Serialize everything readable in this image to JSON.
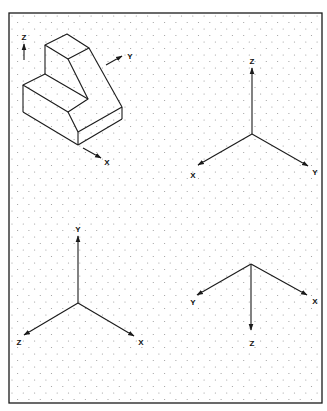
{
  "worksheet": {
    "frame": {
      "x": 9,
      "y": 13,
      "width": 313,
      "height": 390,
      "stroke": "#1a1a1a"
    },
    "dot_grid": {
      "origin_x": 12,
      "origin_y": 16,
      "dx": 11.3,
      "dy": 13,
      "color": "#9a9a9a"
    },
    "line_color": "#1a1a1a"
  },
  "object_view": {
    "title": "isometric-object",
    "axes": [
      {
        "label": "Z",
        "label_pos": [
          24,
          40
        ],
        "from": [
          24,
          60
        ],
        "to": [
          24,
          44
        ]
      },
      {
        "label": "Y",
        "label_pos": [
          130,
          59
        ],
        "from": [
          106,
          65
        ],
        "to": [
          122,
          56
        ]
      },
      {
        "label": "X",
        "label_pos": [
          107,
          165
        ],
        "from": [
          83,
          148
        ],
        "to": [
          101,
          158
        ]
      }
    ]
  },
  "axis_sets": [
    {
      "name": "axes-top-right",
      "origin": [
        252,
        134
      ],
      "axes": [
        {
          "label": "Z",
          "end": [
            252,
            68
          ],
          "label_pos": [
            252,
            64
          ]
        },
        {
          "label": "X",
          "end": [
            198,
            165
          ],
          "label_pos": [
            193,
            178
          ]
        },
        {
          "label": "Y",
          "end": [
            308,
            166
          ],
          "label_pos": [
            315,
            175
          ]
        }
      ]
    },
    {
      "name": "axes-bottom-left",
      "origin": [
        78,
        303
      ],
      "axes": [
        {
          "label": "Y",
          "end": [
            78,
            236
          ],
          "label_pos": [
            78,
            232
          ]
        },
        {
          "label": "Z",
          "end": [
            24,
            335
          ],
          "label_pos": [
            19,
            345
          ]
        },
        {
          "label": "X",
          "end": [
            134,
            336
          ],
          "label_pos": [
            141,
            345
          ]
        }
      ]
    },
    {
      "name": "axes-bottom-right",
      "origin": [
        251,
        264
      ],
      "axes": [
        {
          "label": "Y",
          "end": [
            197,
            295
          ],
          "label_pos": [
            193,
            305
          ]
        },
        {
          "label": "X",
          "end": [
            307,
            295
          ],
          "label_pos": [
            315,
            304
          ]
        },
        {
          "label": "Z",
          "end": [
            251,
            330
          ],
          "label_pos": [
            252,
            346
          ]
        }
      ]
    }
  ]
}
